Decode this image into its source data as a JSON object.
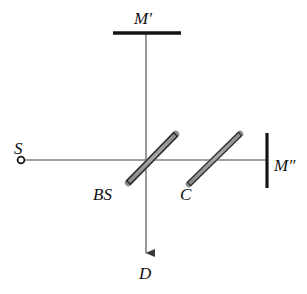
{
  "figure": {
    "kind": "optics-ray-diagram",
    "background_color": "#ffffff",
    "beam_color": "#808080",
    "element_stroke_color": "#1a1a1a",
    "element_fill_color": "#9a9a9a",
    "label_color": "#111111"
  },
  "labels": {
    "mirror_top": "M′",
    "source": "S",
    "mirror_right": "M″",
    "beam_splitter": "BS",
    "compensator": "C",
    "detector": "D"
  },
  "components": [
    {
      "id": "source",
      "name": "S",
      "type": "point-source",
      "x": 21,
      "y": 160
    },
    {
      "id": "mirror-top",
      "name": "M′",
      "type": "mirror",
      "orientation": "horizontal",
      "x1": 113,
      "y1": 33,
      "x2": 181,
      "y2": 33
    },
    {
      "id": "beam-splitter",
      "name": "BS",
      "type": "plate",
      "orientation": "45-deg",
      "x1": 128,
      "y1": 183,
      "x2": 176,
      "y2": 134
    },
    {
      "id": "compensator",
      "name": "C",
      "type": "plate",
      "orientation": "45-deg",
      "x1": 188,
      "y1": 185,
      "x2": 241,
      "y2": 133
    },
    {
      "id": "mirror-right",
      "name": "M″",
      "type": "mirror",
      "orientation": "vertical",
      "x1": 267,
      "y1": 133,
      "x2": 267,
      "y2": 188
    },
    {
      "id": "detector",
      "name": "D",
      "type": "detector",
      "x": 146,
      "y": 266
    }
  ],
  "beams": [
    {
      "id": "source-to-bs",
      "from": "S",
      "to": "BS",
      "x1": 23,
      "y1": 160,
      "x2": 146,
      "y2": 160,
      "arrow": false
    },
    {
      "id": "bs-to-mirror1",
      "from": "BS",
      "to": "M′",
      "x1": 146,
      "y1": 160,
      "x2": 146,
      "y2": 33,
      "arrow": false
    },
    {
      "id": "bs-to-mirror2",
      "from": "BS",
      "to": "M″",
      "x1": 146,
      "y1": 160,
      "x2": 267,
      "y2": 160,
      "arrow": false
    },
    {
      "id": "bs-to-detector",
      "from": "BS",
      "to": "D",
      "x1": 146,
      "y1": 160,
      "x2": 146,
      "y2": 262,
      "arrow": true
    }
  ]
}
